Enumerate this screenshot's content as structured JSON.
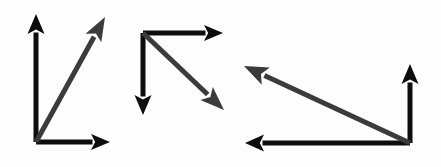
{
  "figure": {
    "title": "Three vector triangle diagrams",
    "background_color": "#fdfdfd",
    "width": 441,
    "height": 167,
    "black": "#0d0d0d",
    "gray": "#3b3b3b"
  },
  "groups": [
    {
      "name": "vector-group-left",
      "label": "Left vector group",
      "origin": {
        "x": 36,
        "y": 142
      },
      "arrows": [
        {
          "name": "arrow-up-left-group",
          "label": "Vertical arrow up",
          "direction": "up",
          "color_key": "black",
          "from": {
            "x": 36,
            "y": 142
          },
          "to": {
            "x": 36,
            "y": 14
          },
          "width": 5,
          "head_length": 20,
          "head_width": 17
        },
        {
          "name": "arrow-right-left-group",
          "label": "Horizontal arrow right",
          "direction": "right",
          "color_key": "black",
          "from": {
            "x": 36,
            "y": 142
          },
          "to": {
            "x": 110,
            "y": 142
          },
          "width": 5,
          "head_length": 19,
          "head_width": 16
        },
        {
          "name": "arrow-diagonal-left-group",
          "label": "Diagonal resultant arrow up-right",
          "direction": "up-right",
          "color_key": "gray",
          "from": {
            "x": 36,
            "y": 142
          },
          "to": {
            "x": 105,
            "y": 17
          },
          "width": 5,
          "head_length": 24,
          "head_width": 18
        }
      ]
    },
    {
      "name": "vector-group-middle",
      "label": "Middle vector group",
      "origin": {
        "x": 143,
        "y": 33
      },
      "arrows": [
        {
          "name": "arrow-right-middle-group",
          "label": "Horizontal arrow right",
          "direction": "right",
          "color_key": "black",
          "from": {
            "x": 143,
            "y": 33
          },
          "to": {
            "x": 223,
            "y": 33
          },
          "width": 5,
          "head_length": 19,
          "head_width": 16
        },
        {
          "name": "arrow-down-middle-group",
          "label": "Vertical arrow down",
          "direction": "down",
          "color_key": "black",
          "from": {
            "x": 143,
            "y": 33
          },
          "to": {
            "x": 143,
            "y": 115
          },
          "width": 5,
          "head_length": 20,
          "head_width": 17
        },
        {
          "name": "arrow-diagonal-middle-group",
          "label": "Diagonal resultant arrow down-right",
          "direction": "down-right",
          "color_key": "gray",
          "from": {
            "x": 143,
            "y": 33
          },
          "to": {
            "x": 224,
            "y": 110
          },
          "width": 5,
          "head_length": 24,
          "head_width": 18
        }
      ]
    },
    {
      "name": "vector-group-right",
      "label": "Right vector group",
      "origin": {
        "x": 410,
        "y": 143
      },
      "arrows": [
        {
          "name": "arrow-up-right-group",
          "label": "Vertical arrow up",
          "direction": "up",
          "color_key": "black",
          "from": {
            "x": 410,
            "y": 143
          },
          "to": {
            "x": 410,
            "y": 64
          },
          "width": 5,
          "head_length": 20,
          "head_width": 17
        },
        {
          "name": "arrow-left-right-group",
          "label": "Horizontal arrow left",
          "direction": "left",
          "color_key": "black",
          "from": {
            "x": 410,
            "y": 143
          },
          "to": {
            "x": 245,
            "y": 143
          },
          "width": 5,
          "head_length": 19,
          "head_width": 17
        },
        {
          "name": "arrow-diagonal-right-group",
          "label": "Diagonal resultant arrow up-left",
          "direction": "up-left",
          "color_key": "gray",
          "from": {
            "x": 410,
            "y": 143
          },
          "to": {
            "x": 244,
            "y": 66
          },
          "width": 5,
          "head_length": 24,
          "head_width": 19
        }
      ]
    }
  ]
}
